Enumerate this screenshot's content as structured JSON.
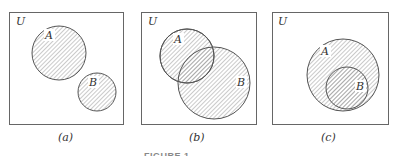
{
  "universe_label": "U",
  "panels": [
    {
      "id": "a",
      "caption": "(a)",
      "description": "A and B disjoint",
      "sets": [
        {
          "label": "A",
          "shaded": true
        },
        {
          "label": "B",
          "shaded": true
        }
      ]
    },
    {
      "id": "b",
      "caption": "(b)",
      "description": "A and B overlapping",
      "sets": [
        {
          "label": "A",
          "shaded": true
        },
        {
          "label": "B",
          "shaded": true
        }
      ]
    },
    {
      "id": "c",
      "caption": "(c)",
      "description": "B subset of A",
      "sets": [
        {
          "label": "A",
          "shaded": true
        },
        {
          "label": "B",
          "shaded": true
        }
      ]
    }
  ],
  "figure_caption": "FIGURE 1-",
  "colors": {
    "stroke": "#555555",
    "hatch": "#8a8a8a",
    "background": "#ffffff"
  }
}
